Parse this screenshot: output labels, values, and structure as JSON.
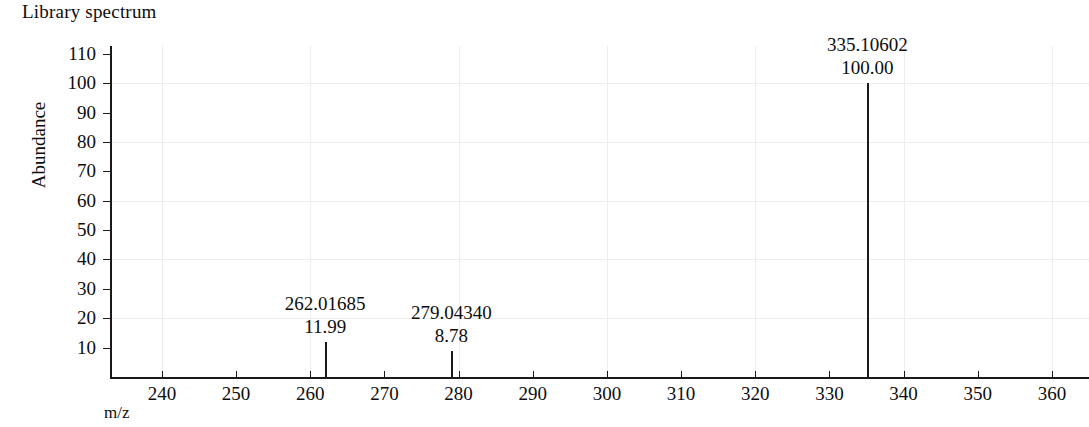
{
  "chart_data": {
    "type": "bar",
    "title": "Library spectrum",
    "xlabel": "m/z",
    "ylabel": "Abundance",
    "xlim": [
      233,
      365
    ],
    "ylim": [
      0,
      113
    ],
    "grid": true,
    "legend": "none",
    "x_ticks": [
      240,
      250,
      260,
      270,
      280,
      290,
      300,
      310,
      320,
      330,
      340,
      350,
      360
    ],
    "y_ticks": [
      10,
      20,
      30,
      40,
      50,
      60,
      70,
      80,
      90,
      100,
      110
    ],
    "x_gridlines": [
      240,
      260,
      280,
      300,
      320,
      340,
      360
    ],
    "y_gridlines": [
      20,
      40,
      60,
      80,
      100
    ],
    "peaks": [
      {
        "mz": 262.01685,
        "mz_label": "262.01685",
        "intensity": 11.99,
        "intensity_label": "11.99"
      },
      {
        "mz": 279.0434,
        "mz_label": "279.04340",
        "intensity": 8.78,
        "intensity_label": "8.78"
      },
      {
        "mz": 335.10602,
        "mz_label": "335.10602",
        "intensity": 100.0,
        "intensity_label": "100.00"
      }
    ],
    "colors": {
      "axis": "#1a1a1a",
      "peak": "#1a1a1a",
      "grid": "#eceef1",
      "background": "#ffffff"
    }
  },
  "axis": {
    "y_tick_labels": [
      "110",
      "100",
      "90",
      "80",
      "70",
      "60",
      "50",
      "40",
      "30",
      "20",
      "10"
    ],
    "x_tick_labels": [
      "240",
      "250",
      "260",
      "270",
      "280",
      "290",
      "300",
      "310",
      "320",
      "330",
      "340",
      "350",
      "360"
    ]
  }
}
